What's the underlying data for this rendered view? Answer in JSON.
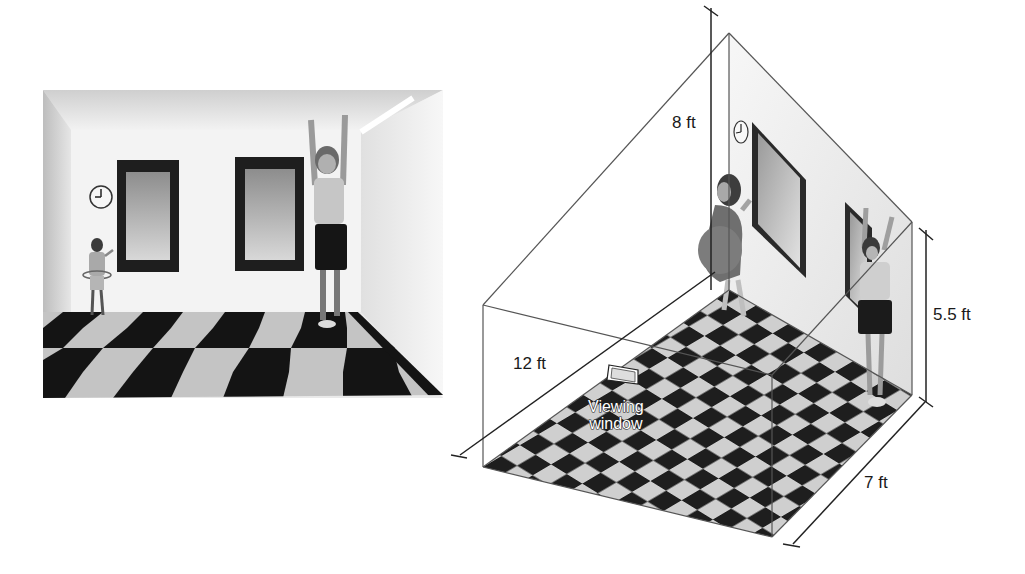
{
  "figure": {
    "photo": {
      "description": "Photograph of Ames room: small girl on left, tall boy on right, checkerboard floor",
      "elements": [
        "clock",
        "left-window",
        "right-window",
        "girl",
        "boy",
        "checkerboard-floor"
      ]
    },
    "diagram": {
      "dimensions": {
        "height_back": "8 ft",
        "height_front": "5.5 ft",
        "depth_left": "12 ft",
        "width_right": "7 ft"
      },
      "viewing_window": {
        "line1": "Viewing",
        "line2": "window"
      }
    }
  },
  "colors": {
    "tile_dark": "#1c1c1c",
    "tile_light": "#c9c9c9",
    "wall": "#f2f2f2",
    "line": "#444444",
    "frame": "#2b2b2b"
  }
}
